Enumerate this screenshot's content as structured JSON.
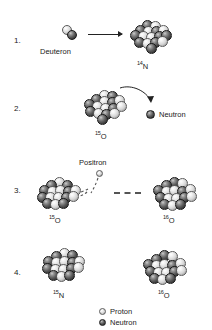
{
  "diagram": {
    "background_color": "#ffffff",
    "proton_color": "#e8e8e8",
    "neutron_color": "#3a3a3a"
  },
  "steps": [
    {
      "number": "1.",
      "caption_left": "Deuteron",
      "nuclide_mass": "14",
      "nuclide_symbol": "N",
      "arrow": "straight-right"
    },
    {
      "number": "2.",
      "nuclide_mass": "15",
      "nuclide_symbol": "O",
      "emitted_label": "Neutron",
      "arrow": "curved-right"
    },
    {
      "number": "3.",
      "emitted_label": "Positron",
      "nuclide_left_mass": "15",
      "nuclide_left_symbol": "O",
      "nuclide_right_mass": "16",
      "nuclide_right_symbol": "O",
      "connector": "dashed"
    },
    {
      "number": "4.",
      "nuclide_left_mass": "15",
      "nuclide_left_symbol": "N",
      "nuclide_right_mass": "16",
      "nuclide_right_symbol": "O"
    }
  ],
  "legend": {
    "items": [
      {
        "label": "Proton",
        "kind": "proton"
      },
      {
        "label": "Neutron",
        "kind": "neutron"
      }
    ]
  },
  "clusters": {
    "deuteron": [
      {
        "x": 0,
        "y": 0,
        "r": 5.0,
        "t": "p"
      },
      {
        "x": 4.5,
        "y": 5.0,
        "r": 5.2,
        "t": "n"
      }
    ],
    "n14": [
      {
        "x": 14,
        "y": 0,
        "r": 5.4,
        "t": "n"
      },
      {
        "x": 22,
        "y": 1,
        "r": 5.4,
        "t": "p"
      },
      {
        "x": 7,
        "y": 5,
        "r": 5.4,
        "t": "n"
      },
      {
        "x": 15,
        "y": 6,
        "r": 5.6,
        "t": "p"
      },
      {
        "x": 23,
        "y": 6,
        "r": 5.4,
        "t": "n"
      },
      {
        "x": 30,
        "y": 5,
        "r": 5.4,
        "t": "p"
      },
      {
        "x": 2,
        "y": 10,
        "r": 5.4,
        "t": "n"
      },
      {
        "x": 10,
        "y": 11,
        "r": 5.6,
        "t": "p"
      },
      {
        "x": 18,
        "y": 12,
        "r": 5.6,
        "t": "p"
      },
      {
        "x": 26,
        "y": 11,
        "r": 5.4,
        "t": "n"
      },
      {
        "x": 33,
        "y": 10,
        "r": 5.4,
        "t": "n"
      },
      {
        "x": 6,
        "y": 17,
        "r": 5.4,
        "t": "n"
      },
      {
        "x": 14,
        "y": 18,
        "r": 5.6,
        "t": "p"
      },
      {
        "x": 22,
        "y": 17,
        "r": 5.4,
        "t": "n"
      },
      {
        "x": 29,
        "y": 16,
        "r": 5.4,
        "t": "p"
      },
      {
        "x": 18,
        "y": 23,
        "r": 5.4,
        "t": "n"
      }
    ],
    "o15_a": [
      {
        "x": 17,
        "y": 0,
        "r": 5.4,
        "t": "p"
      },
      {
        "x": 25,
        "y": 1,
        "r": 5.4,
        "t": "n"
      },
      {
        "x": 9,
        "y": 4,
        "r": 5.4,
        "t": "n"
      },
      {
        "x": 17,
        "y": 6,
        "r": 5.6,
        "t": "p"
      },
      {
        "x": 25,
        "y": 7,
        "r": 5.4,
        "t": "n"
      },
      {
        "x": 32,
        "y": 5,
        "r": 5.4,
        "t": "p"
      },
      {
        "x": 2,
        "y": 9,
        "r": 5.4,
        "t": "n"
      },
      {
        "x": 10,
        "y": 11,
        "r": 5.6,
        "t": "p"
      },
      {
        "x": 18,
        "y": 13,
        "r": 5.6,
        "t": "p"
      },
      {
        "x": 26,
        "y": 13,
        "r": 5.4,
        "t": "n"
      },
      {
        "x": 34,
        "y": 11,
        "r": 5.4,
        "t": "p"
      },
      {
        "x": 3,
        "y": 16,
        "r": 5.4,
        "t": "n"
      },
      {
        "x": 11,
        "y": 18,
        "r": 5.6,
        "t": "p"
      },
      {
        "x": 19,
        "y": 19,
        "r": 5.4,
        "t": "n"
      },
      {
        "x": 27,
        "y": 18,
        "r": 5.4,
        "t": "p"
      },
      {
        "x": 15,
        "y": 24,
        "r": 5.4,
        "t": "n"
      }
    ],
    "o15_b": [
      {
        "x": 18,
        "y": 0,
        "r": 5.4,
        "t": "p"
      },
      {
        "x": 10,
        "y": 3,
        "r": 5.4,
        "t": "n"
      },
      {
        "x": 26,
        "y": 3,
        "r": 5.4,
        "t": "n"
      },
      {
        "x": 3,
        "y": 8,
        "r": 5.4,
        "t": "n"
      },
      {
        "x": 11,
        "y": 9,
        "r": 5.6,
        "t": "p"
      },
      {
        "x": 19,
        "y": 8,
        "r": 5.6,
        "t": "p"
      },
      {
        "x": 27,
        "y": 9,
        "r": 5.4,
        "t": "n"
      },
      {
        "x": 34,
        "y": 8,
        "r": 5.4,
        "t": "p"
      },
      {
        "x": 1,
        "y": 15,
        "r": 5.4,
        "t": "n"
      },
      {
        "x": 9,
        "y": 15,
        "r": 5.6,
        "t": "p"
      },
      {
        "x": 17,
        "y": 15,
        "r": 5.6,
        "t": "p"
      },
      {
        "x": 25,
        "y": 15,
        "r": 5.4,
        "t": "n"
      },
      {
        "x": 32,
        "y": 14,
        "r": 5.4,
        "t": "p"
      },
      {
        "x": 6,
        "y": 21,
        "r": 5.4,
        "t": "n"
      },
      {
        "x": 14,
        "y": 22,
        "r": 5.6,
        "t": "p"
      },
      {
        "x": 22,
        "y": 21,
        "r": 5.4,
        "t": "n"
      }
    ],
    "o16_a": [
      {
        "x": 16,
        "y": 0,
        "r": 5.4,
        "t": "n"
      },
      {
        "x": 24,
        "y": 1,
        "r": 5.4,
        "t": "p"
      },
      {
        "x": 8,
        "y": 3,
        "r": 5.4,
        "t": "n"
      },
      {
        "x": 0,
        "y": 8,
        "r": 5.4,
        "t": "n"
      },
      {
        "x": 8,
        "y": 9,
        "r": 5.6,
        "t": "p"
      },
      {
        "x": 16,
        "y": 8,
        "r": 5.6,
        "t": "p"
      },
      {
        "x": 24,
        "y": 9,
        "r": 5.4,
        "t": "n"
      },
      {
        "x": 32,
        "y": 7,
        "r": 5.4,
        "t": "p"
      },
      {
        "x": 2,
        "y": 15,
        "r": 5.4,
        "t": "n"
      },
      {
        "x": 10,
        "y": 16,
        "r": 5.6,
        "t": "p"
      },
      {
        "x": 18,
        "y": 16,
        "r": 5.6,
        "t": "p"
      },
      {
        "x": 26,
        "y": 15,
        "r": 5.4,
        "t": "n"
      },
      {
        "x": 33,
        "y": 14,
        "r": 5.4,
        "t": "p"
      },
      {
        "x": 6,
        "y": 22,
        "r": 5.4,
        "t": "n"
      },
      {
        "x": 14,
        "y": 23,
        "r": 5.6,
        "t": "p"
      },
      {
        "x": 22,
        "y": 22,
        "r": 5.4,
        "t": "n"
      }
    ],
    "n15": [
      {
        "x": 18,
        "y": 0,
        "r": 5.4,
        "t": "p"
      },
      {
        "x": 26,
        "y": 2,
        "r": 5.4,
        "t": "n"
      },
      {
        "x": 10,
        "y": 3,
        "r": 5.4,
        "t": "n"
      },
      {
        "x": 2,
        "y": 8,
        "r": 5.4,
        "t": "n"
      },
      {
        "x": 10,
        "y": 9,
        "r": 5.6,
        "t": "p"
      },
      {
        "x": 18,
        "y": 8,
        "r": 5.6,
        "t": "p"
      },
      {
        "x": 26,
        "y": 9,
        "r": 5.4,
        "t": "n"
      },
      {
        "x": 33,
        "y": 8,
        "r": 5.4,
        "t": "p"
      },
      {
        "x": 1,
        "y": 15,
        "r": 5.4,
        "t": "n"
      },
      {
        "x": 9,
        "y": 16,
        "r": 5.6,
        "t": "p"
      },
      {
        "x": 17,
        "y": 16,
        "r": 5.6,
        "t": "p"
      },
      {
        "x": 25,
        "y": 15,
        "r": 5.4,
        "t": "n"
      },
      {
        "x": 32,
        "y": 14,
        "r": 5.4,
        "t": "p"
      },
      {
        "x": 7,
        "y": 22,
        "r": 5.4,
        "t": "n"
      },
      {
        "x": 15,
        "y": 23,
        "r": 5.6,
        "t": "p"
      },
      {
        "x": 23,
        "y": 22,
        "r": 5.4,
        "t": "n"
      }
    ],
    "o16_b": [
      {
        "x": 16,
        "y": 0,
        "r": 5.4,
        "t": "n"
      },
      {
        "x": 24,
        "y": 1,
        "r": 5.4,
        "t": "p"
      },
      {
        "x": 8,
        "y": 4,
        "r": 5.4,
        "t": "n"
      },
      {
        "x": 0,
        "y": 9,
        "r": 5.4,
        "t": "n"
      },
      {
        "x": 8,
        "y": 10,
        "r": 5.6,
        "t": "p"
      },
      {
        "x": 16,
        "y": 9,
        "r": 5.6,
        "t": "p"
      },
      {
        "x": 24,
        "y": 10,
        "r": 5.4,
        "t": "n"
      },
      {
        "x": 32,
        "y": 8,
        "r": 5.4,
        "t": "p"
      },
      {
        "x": 2,
        "y": 16,
        "r": 5.4,
        "t": "n"
      },
      {
        "x": 10,
        "y": 17,
        "r": 5.6,
        "t": "p"
      },
      {
        "x": 18,
        "y": 17,
        "r": 5.6,
        "t": "p"
      },
      {
        "x": 26,
        "y": 16,
        "r": 5.4,
        "t": "n"
      },
      {
        "x": 33,
        "y": 15,
        "r": 5.4,
        "t": "p"
      },
      {
        "x": 6,
        "y": 23,
        "r": 5.4,
        "t": "n"
      },
      {
        "x": 14,
        "y": 24,
        "r": 5.6,
        "t": "p"
      },
      {
        "x": 22,
        "y": 23,
        "r": 5.4,
        "t": "n"
      }
    ]
  }
}
